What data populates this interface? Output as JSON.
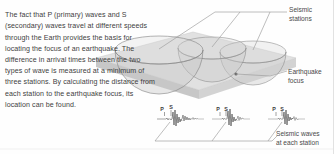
{
  "figure": {
    "body_text": "The fact that P (primary) waves and S (secondary) waves travel at different speeds through the Earth provides the basis for locating the focus of an earthquake. The difference in arrival times between the two types of wave is measured at a minimum of three stations. By calculating the distance from each station to the earthquake focus, its location can be found."
  },
  "labels": {
    "seismic_stations": "Seismic\nstations",
    "earthquake_focus": "Earthquake\nfocus",
    "seismic_waves": "Seismic waves\nat each station"
  },
  "seismograms": [
    {
      "p_label": "P",
      "s_label": "S"
    },
    {
      "p_label": "P",
      "s_label": "S"
    },
    {
      "p_label": "P",
      "s_label": "S"
    }
  ],
  "colors": {
    "background": "#fefefe",
    "text": "#3e3e3e",
    "label_text": "#4a4a4a",
    "leader_line": "#9a9a9a",
    "ground_top": "#dcdcdc",
    "ground_front": "#cbcbcb",
    "ground_side": "#bdbdbd",
    "sphere_fill": "#c9c9c9",
    "sphere_stroke": "#8c8c8c",
    "trace": "#555555",
    "border": "#e2e2e2"
  },
  "icons": {
    "hemisphere": "hemisphere-icon",
    "ground_plane": "ground-plane-icon",
    "seismogram": "seismogram-icon"
  }
}
